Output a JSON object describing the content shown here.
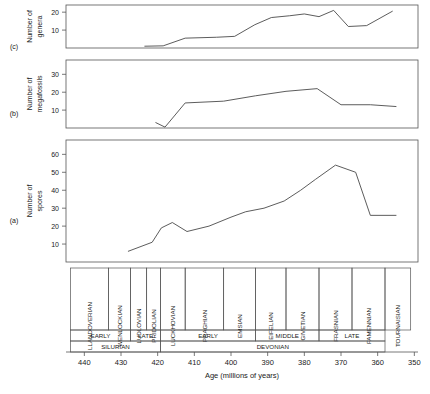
{
  "figure": {
    "width": 430,
    "height": 394,
    "background": "#ffffff",
    "line_color": "#4a4a4a",
    "axis_color": "#555555",
    "text_color": "#1a1a1a",
    "xlabel": "Age (millions of years)",
    "x_tick_labels": [
      "440",
      "430",
      "420",
      "410",
      "400",
      "390",
      "380",
      "370",
      "360",
      "350"
    ],
    "x_ticks": [
      440,
      430,
      420,
      410,
      400,
      390,
      380,
      370,
      360,
      350
    ],
    "xlim": [
      445,
      349
    ],
    "panel_labels": [
      "(a)",
      "(b)",
      "(c)"
    ]
  },
  "timescale": {
    "stages_header": "stages",
    "stages": [
      {
        "name": "LLANDOVERIAN",
        "start": 443.8,
        "end": 433.4
      },
      {
        "name": "WENLOCKIAN",
        "start": 433.4,
        "end": 427.4
      },
      {
        "name": "LUDLOVIAN",
        "start": 427.4,
        "end": 423.0
      },
      {
        "name": "PRIDOLIAN",
        "start": 423.0,
        "end": 419.2
      },
      {
        "name": "LUCKHOVIAN",
        "start": 419.2,
        "end": 412.5
      },
      {
        "name": "PRAGHIAN",
        "start": 412.5,
        "end": 402.0
      },
      {
        "name": "EMSIAN",
        "start": 402.0,
        "end": 393.3
      },
      {
        "name": "EIFELIAN",
        "start": 393.3,
        "end": 385.0
      },
      {
        "name": "GIVETIAN",
        "start": 385.0,
        "end": 376.0
      },
      {
        "name": "FRASNIAN",
        "start": 376.0,
        "end": 367.0
      },
      {
        "name": "FAMENNIAN",
        "start": 367.0,
        "end": 358.0
      },
      {
        "name": "TOURNAISIAN",
        "start": 358.0,
        "end": 351.0
      }
    ],
    "epochs": [
      {
        "name": "EARLY",
        "start": 443.8,
        "end": 427.4
      },
      {
        "name": "LATE",
        "start": 427.4,
        "end": 419.2
      },
      {
        "name": "EARLY",
        "start": 419.2,
        "end": 393.3
      },
      {
        "name": "MIDDLE",
        "start": 393.3,
        "end": 376.0
      },
      {
        "name": "LATE",
        "start": 376.0,
        "end": 358.0
      }
    ],
    "periods": [
      {
        "name": "SILURIAN",
        "start": 443.8,
        "end": 419.2
      },
      {
        "name": "DEVONIAN",
        "start": 419.2,
        "end": 358.0
      }
    ]
  },
  "chart_data": [
    {
      "type": "line",
      "panel": "(a)",
      "title": "",
      "ylabel": "Number of spores",
      "xlabel": "Age (millions of years)",
      "ylim": [
        0,
        68
      ],
      "xlim": [
        445,
        349
      ],
      "y_ticks": [
        10,
        20,
        30,
        40,
        50,
        60
      ],
      "y_tick_labels": [
        "10",
        "20",
        "30",
        "40",
        "50",
        "60"
      ],
      "grid": false,
      "x": [
        428.0,
        421.5,
        419.0,
        416.0,
        412.0,
        406.0,
        400.0,
        396.0,
        391.0,
        385.5,
        381.0,
        377.0,
        371.5,
        366.0,
        362.0,
        355.0
      ],
      "values": [
        6,
        11,
        19,
        22,
        17,
        20,
        25,
        28,
        30,
        34,
        40,
        46,
        54,
        50,
        26,
        26
      ]
    },
    {
      "type": "line",
      "panel": "(b)",
      "title": "",
      "ylabel": "Number of megafossils",
      "ylim": [
        0,
        38
      ],
      "xlim": [
        445,
        349
      ],
      "y_ticks": [
        10,
        20,
        30
      ],
      "y_tick_labels": [
        "10",
        "20",
        "30"
      ],
      "grid": false,
      "x": [
        420.5,
        418.0,
        412.5,
        402.0,
        393.3,
        385.0,
        376.5,
        370.0,
        362.0,
        355.0
      ],
      "values": [
        3,
        0.5,
        14,
        15,
        18,
        20.5,
        22,
        13,
        13,
        12
      ]
    },
    {
      "type": "line",
      "panel": "(c)",
      "title": "",
      "ylabel": "Number of genera",
      "ylim": [
        0,
        24
      ],
      "xlim": [
        445,
        349
      ],
      "y_ticks": [
        10,
        20
      ],
      "y_tick_labels": [
        "10",
        "20"
      ],
      "grid": false,
      "x": [
        423.5,
        418.5,
        412.5,
        404.0,
        399.0,
        393.5,
        389.0,
        384.0,
        380.0,
        376.0,
        372.0,
        368.0,
        363.0,
        356.0
      ],
      "values": [
        1,
        1.2,
        5.5,
        6,
        6.5,
        13,
        17,
        18,
        19,
        17.5,
        21,
        12,
        12.5,
        20.5
      ]
    }
  ]
}
